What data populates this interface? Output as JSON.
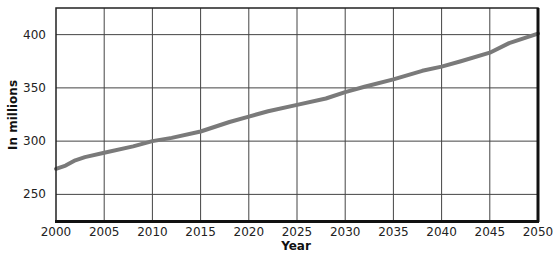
{
  "chart_data": {
    "type": "line",
    "title": "",
    "xlabel": "Year",
    "ylabel": "In millions",
    "xlim": [
      2000,
      2050
    ],
    "ylim": [
      225,
      425
    ],
    "grid": true,
    "legend": null,
    "x_ticks": [
      2000,
      2005,
      2010,
      2015,
      2020,
      2025,
      2030,
      2035,
      2040,
      2045,
      2050
    ],
    "y_ticks": [
      250,
      300,
      350,
      400
    ],
    "series": [
      {
        "name": "Population",
        "color": "#7a7a7a",
        "x": [
          2000,
          2001,
          2002,
          2003,
          2005,
          2008,
          2010,
          2012,
          2015,
          2018,
          2020,
          2022,
          2025,
          2028,
          2030,
          2032,
          2035,
          2038,
          2040,
          2042,
          2045,
          2047,
          2050
        ],
        "values": [
          274,
          277,
          282,
          285,
          289,
          295,
          300,
          303,
          309,
          318,
          323,
          328,
          334,
          340,
          346,
          351,
          358,
          366,
          370,
          375,
          383,
          392,
          401
        ]
      }
    ]
  }
}
